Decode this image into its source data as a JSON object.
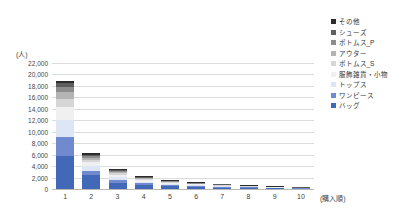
{
  "chart_data": {
    "type": "bar",
    "subtype": "stacked-column",
    "title": "",
    "xlabel": "(購入順)",
    "ylabel": "(人)",
    "categories": [
      "1",
      "2",
      "3",
      "4",
      "5",
      "6",
      "7",
      "8",
      "9",
      "10"
    ],
    "ylim": [
      0,
      22000
    ],
    "ytick_labels": [
      "22,000",
      "20,000",
      "18,000",
      "16,000",
      "14,000",
      "12,000",
      "10,000",
      "8,000",
      "6,000",
      "4,000",
      "2,000",
      "0"
    ],
    "ytick_values": [
      22000,
      20000,
      18000,
      16000,
      14000,
      12000,
      10000,
      8000,
      6000,
      4000,
      2000,
      0
    ],
    "ytick_interval": 2000,
    "grid": true,
    "grid_axis": "y",
    "legend_position": "right-top",
    "series": [
      {
        "name": "バッグ",
        "color": "#4269b8",
        "values": [
          5700,
          2400,
          1100,
          700,
          500,
          380,
          260,
          190,
          140,
          90
        ]
      },
      {
        "name": "ワンピース",
        "color": "#7189ce",
        "values": [
          3300,
          700,
          450,
          280,
          190,
          140,
          110,
          80,
          60,
          40
        ]
      },
      {
        "name": "トップス",
        "color": "#dce6f4",
        "values": [
          3000,
          850,
          500,
          300,
          200,
          150,
          110,
          80,
          60,
          40
        ]
      },
      {
        "name": "服飾雑貨・小物",
        "color": "#f0f0f0",
        "values": [
          2400,
          700,
          420,
          260,
          180,
          130,
          100,
          70,
          55,
          35
        ]
      },
      {
        "name": "ボトムス_S",
        "color": "#d6d6d6",
        "values": [
          1400,
          400,
          260,
          170,
          120,
          90,
          70,
          50,
          40,
          25
        ]
      },
      {
        "name": "アウター",
        "color": "#b4b4b4",
        "values": [
          1100,
          350,
          230,
          150,
          110,
          80,
          60,
          45,
          35,
          22
        ]
      },
      {
        "name": "ボトムス_P",
        "color": "#8c8c8c",
        "values": [
          900,
          300,
          200,
          130,
          95,
          70,
          55,
          40,
          30,
          20
        ]
      },
      {
        "name": "シューズ",
        "color": "#5e5e5e",
        "values": [
          650,
          260,
          170,
          110,
          80,
          60,
          45,
          35,
          25,
          18
        ]
      },
      {
        "name": "その他",
        "color": "#2b2b2b",
        "values": [
          350,
          300,
          220,
          160,
          120,
          90,
          70,
          55,
          45,
          30
        ]
      }
    ],
    "legend_entries": [
      {
        "label": "その他",
        "color": "#2b2b2b"
      },
      {
        "label": "シューズ",
        "color": "#5e5e5e"
      },
      {
        "label": "ボトムス_P",
        "color": "#8c8c8c"
      },
      {
        "label": "アウター",
        "color": "#b4b4b4"
      },
      {
        "label": "ボトムス_S",
        "color": "#d6d6d6"
      },
      {
        "label": "服飾雑貨・小物",
        "color": "#f0f0f0"
      },
      {
        "label": "トップス",
        "color": "#dce6f4"
      },
      {
        "label": "ワンピース",
        "color": "#7189ce"
      },
      {
        "label": "バッグ",
        "color": "#4269b8"
      }
    ],
    "totals": [
      18800,
      6260,
      3550,
      2260,
      1595,
      1190,
      880,
      645,
      490,
      320
    ]
  }
}
